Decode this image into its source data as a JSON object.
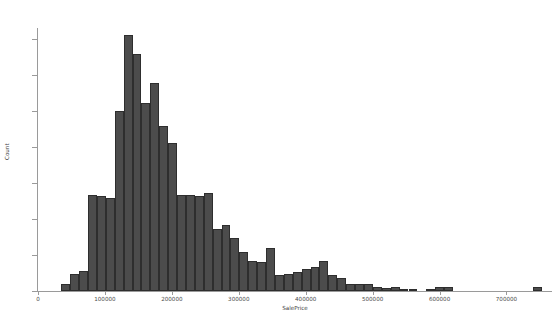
{
  "chart_data": {
    "type": "bar",
    "title": "",
    "xlabel": "SalePrice",
    "ylabel": "Count",
    "xlim": [
      0,
      768000
    ],
    "ylim": [
      0,
      183
    ],
    "grid": false,
    "legend": null,
    "bar_color": "#4c4c4c",
    "edge_color": "#2e2e2e",
    "background": "#ffffff",
    "bin_width": 13300,
    "bin_start": 34900,
    "xticks": [
      0,
      100000,
      200000,
      300000,
      400000,
      500000,
      600000,
      700000
    ],
    "xtick_labels": [
      "0",
      "100000",
      "200000",
      "300000",
      "400000",
      "500000",
      "600000",
      "700000"
    ],
    "yticks": [
      0,
      25,
      50,
      75,
      100,
      125,
      150,
      175
    ],
    "ytick_labels": [
      "0",
      "25",
      "50",
      "75",
      "100",
      "125",
      "150",
      "175"
    ],
    "x": [
      41550,
      54850,
      68150,
      81450,
      94750,
      108050,
      121350,
      134650,
      147950,
      161250,
      174550,
      187850,
      201150,
      214450,
      227750,
      241050,
      254350,
      267650,
      280950,
      294250,
      307550,
      320850,
      334150,
      347450,
      360750,
      374050,
      387350,
      400650,
      413950,
      427250,
      440550,
      453850,
      467150,
      480450,
      493750,
      507050,
      520350,
      533650,
      546950,
      560250,
      573550,
      586850,
      600150,
      613450,
      626750,
      640050,
      653350,
      666650,
      679950,
      693250,
      706550,
      719850,
      733150,
      746450
    ],
    "values": [
      5,
      12,
      14,
      67,
      66,
      65,
      125,
      178,
      165,
      131,
      145,
      115,
      103,
      67,
      67,
      66,
      68,
      43,
      46,
      37,
      27,
      21,
      20,
      30,
      11,
      12,
      13,
      15,
      17,
      21,
      11,
      9,
      5,
      5,
      5,
      3,
      2,
      3,
      1,
      1,
      0,
      1,
      3,
      3,
      0,
      0,
      0,
      0,
      0,
      0,
      0,
      0,
      0,
      3
    ]
  },
  "axes": {
    "x_title": "SalePrice",
    "y_title": "Count"
  }
}
